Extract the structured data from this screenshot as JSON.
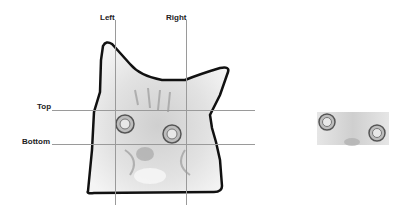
{
  "labels": {
    "left": "Left",
    "right": "Right",
    "top": "Top",
    "bottom": "Bottom"
  },
  "figure": {
    "source_image": "cat-face-grayscale",
    "crop_result": "cropped-cat-eyes"
  },
  "colors": {
    "guide_line": "#9a9a9a",
    "label": "#222222",
    "outline": "#111111"
  }
}
